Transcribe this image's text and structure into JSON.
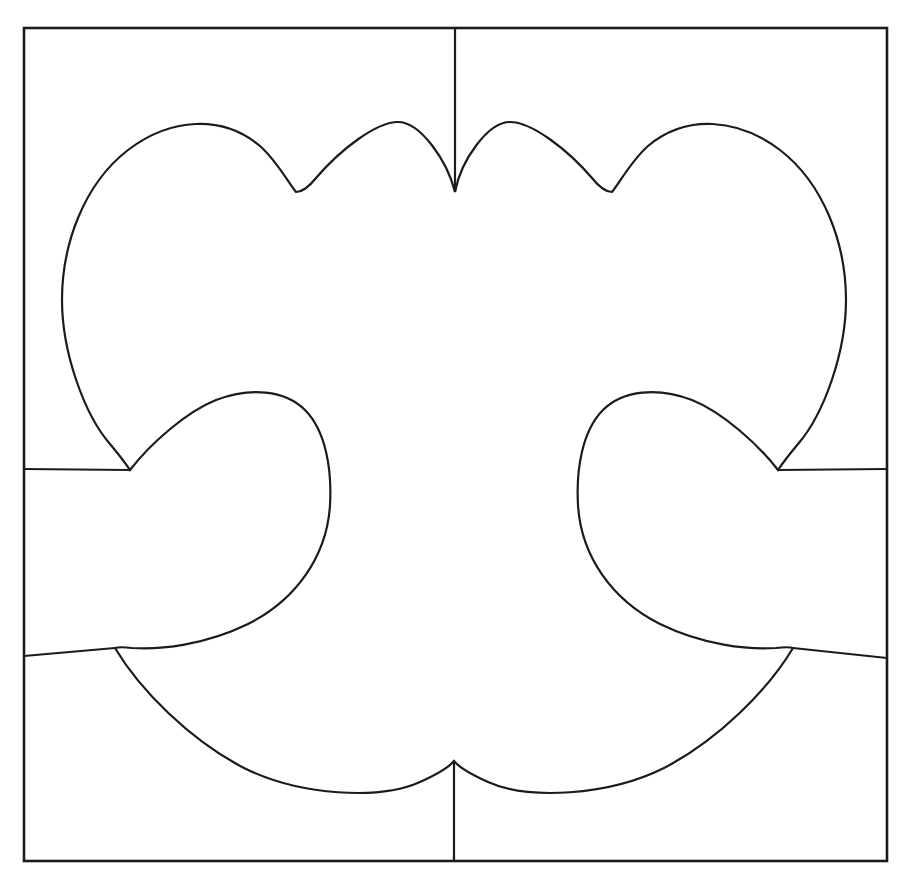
{
  "document": {
    "title": "Symmetric lobed cut-out pattern in square frame",
    "clipped_header_text": "",
    "background_color": "#ffffff",
    "ink_color": "#1b1b1b"
  },
  "canvas": {
    "width": 901,
    "height": 880
  },
  "frame": {
    "name": "square-border",
    "left": 24,
    "top": 28,
    "right": 887,
    "bottom": 861,
    "stroke_width": 2.6,
    "stroke_color": "#1b1b1b",
    "fill": "none"
  },
  "shape": {
    "name": "lobed-symmetric-figure",
    "description": "Bilaterally symmetric outline with two large outer lobes, two small inner bumps at top, two inward-curling hooks at mid-height, and two shallow arcs along the bottom.",
    "symmetry_axis_x": 455,
    "stroke_width": 2.2,
    "stroke_color": "#1b1b1b",
    "fill": "#ffffff",
    "path": "M 455 192 C 447 160 420 122 398 122 C 376 122 340 150 316 178 C 308 188 301 192 296 192 C 288 182 276 160 260 146 C 222 114 170 118 128 150 C 84 184 62 244 62 300 C 62 352 84 414 110 444 C 120 456 126 464 130 470 C 150 444 186 412 216 400 C 250 387 285 390 305 410 C 326 431 332 470 330 505 C 327 556 296 600 248 624 C 205 645 160 650 132 648 C 124 647 118 647 115 648 C 140 690 190 740 244 768 C 300 796 380 800 420 782 C 440 773 450 766 454 761 C 458 766 468 773 488 782 C 528 800 608 796 664 768 C 718 740 768 690 793 648 C 790 647 784 647 776 648 C 748 650 703 645 660 624 C 612 600 581 556 578 505 C 576 470 582 431 603 410 C 623 390 658 387 692 400 C 722 412 758 444 778 470 C 782 464 788 456 798 444 C 824 414 846 352 846 300 C 846 244 824 184 780 150 C 738 118 686 114 648 146 C 632 160 620 182 612 192 C 607 192 600 188 592 178 C 568 150 532 122 510 122 C 488 122 461 160 455 192 Z"
  },
  "dividers": [
    {
      "name": "top-center-seam",
      "from_x": 455,
      "from_y": 28,
      "to_x": 455,
      "to_y": 192
    },
    {
      "name": "bottom-center-seam",
      "from_x": 454,
      "from_y": 761,
      "to_x": 454,
      "to_y": 861
    },
    {
      "name": "left-upper-seam",
      "from_x": 24,
      "from_y": 469,
      "to_x": 130,
      "to_y": 470
    },
    {
      "name": "right-upper-seam",
      "from_x": 778,
      "from_y": 470,
      "to_x": 887,
      "to_y": 469
    },
    {
      "name": "left-lower-seam",
      "from_x": 24,
      "from_y": 656,
      "to_x": 115,
      "to_y": 648
    },
    {
      "name": "right-lower-seam",
      "from_x": 793,
      "from_y": 648,
      "to_x": 887,
      "to_y": 658
    }
  ],
  "landmarks": {
    "top_center_cusp": [
      455,
      192
    ],
    "inner_bump_left_peak": [
      398,
      122
    ],
    "inner_bump_right_peak": [
      510,
      122
    ],
    "outer_cusp_left": [
      296,
      192
    ],
    "outer_cusp_right": [
      612,
      192
    ],
    "leftmost_point": [
      62,
      302
    ],
    "rightmost_point": [
      846,
      302
    ],
    "side_cusp_left": [
      130,
      470
    ],
    "side_cusp_right": [
      778,
      470
    ],
    "hook_tip_left": [
      285,
      398
    ],
    "hook_tip_right": [
      625,
      398
    ],
    "lower_junction_left": [
      115,
      648
    ],
    "lower_junction_right": [
      793,
      648
    ],
    "bottom_center_peak": [
      454,
      761
    ],
    "bottom_arc_low_left": [
      330,
      790
    ],
    "bottom_arc_low_right": [
      578,
      790
    ]
  }
}
